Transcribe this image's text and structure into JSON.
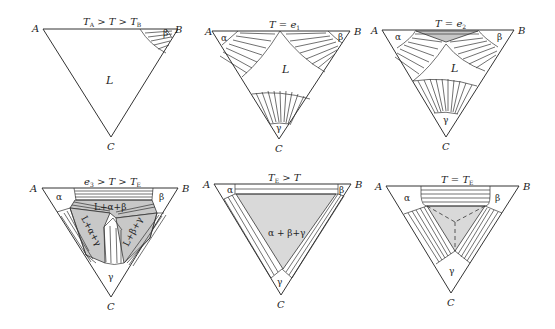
{
  "figure": {
    "vertex_labels": {
      "A": "A",
      "B": "B",
      "C": "C"
    },
    "panels": [
      {
        "id": 1,
        "title_main": "T",
        "title_text": "T_A > T > T_B",
        "title_parts": [
          "T",
          "A",
          " > T > T",
          "B"
        ],
        "phases": {
          "liquid": "L",
          "beta": "β"
        }
      },
      {
        "id": 2,
        "title_text": "T = e_1",
        "title_parts": [
          "T = e",
          "1"
        ],
        "phases": {
          "liquid": "L",
          "alpha": "α",
          "beta": "β",
          "gamma": "γ"
        }
      },
      {
        "id": 3,
        "title_text": "T = e_2",
        "title_parts": [
          "T = e",
          "2"
        ],
        "phases": {
          "liquid": "L",
          "alpha": "α",
          "beta": "β",
          "gamma": "γ"
        }
      },
      {
        "id": 4,
        "title_text": "e_3 > T > T_E",
        "title_parts": [
          "e",
          "3",
          " > T > T",
          "E"
        ],
        "phases": {
          "alpha": "α",
          "beta": "β",
          "gamma": "γ",
          "l_a_b": "L+α+β",
          "l_a_g": "L+α+γ",
          "l_b_g": "L+β+γ"
        }
      },
      {
        "id": 5,
        "title_text": "T_E > T",
        "title_parts": [
          "T",
          "E",
          " > T"
        ],
        "phases": {
          "alpha": "α",
          "beta": "β",
          "gamma": "γ",
          "three_phase": "α + β+γ"
        }
      },
      {
        "id": 6,
        "title_text": "T = T_E",
        "title_parts": [
          "T = T",
          "E"
        ],
        "phases": {
          "alpha": "α",
          "beta": "β",
          "gamma": "γ"
        }
      }
    ],
    "colors": {
      "line": "#333333",
      "shade_dark": "#b8b8b8",
      "shade_light": "#d9d9d9",
      "background": "#ffffff"
    }
  }
}
